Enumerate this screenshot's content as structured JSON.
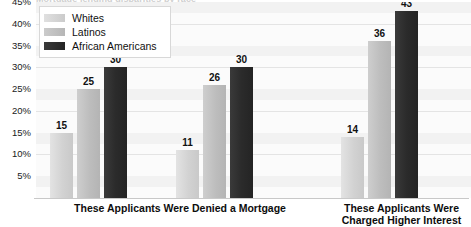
{
  "chart_data": {
    "type": "bar",
    "title": "Mortgage lending disparities by race",
    "categories": [
      "These Applicants Were Denied a Mortgage",
      "These Applicants Were Denied a Mortgage",
      "These Applicants Were Charged Higher Interest"
    ],
    "series": [
      {
        "name": "Whites",
        "values": [
          15,
          11,
          14
        ],
        "color": "#d2d2d2"
      },
      {
        "name": "Latinos",
        "values": [
          25,
          26,
          36
        ],
        "color": "#bdbdbd"
      },
      {
        "name": "African Americans",
        "values": [
          30,
          30,
          43
        ],
        "color": "#2b2b2b"
      }
    ],
    "xlabel": "",
    "ylabel": "",
    "ylim": [
      0,
      45
    ],
    "ytick_labels": [
      "45%",
      "40%",
      "35%",
      "30%",
      "25%",
      "20%",
      "15%",
      "10%",
      "5%"
    ],
    "ytick_values": [
      45,
      40,
      35,
      30,
      25,
      20,
      15,
      10,
      5
    ],
    "grid": true,
    "legend_position": "top-left",
    "value_labels": true
  },
  "legend": {
    "items": [
      {
        "label": "Whites"
      },
      {
        "label": "Latinos"
      },
      {
        "label": "African Americans"
      }
    ]
  },
  "categories": [
    {
      "line1": "These Applicants Were Denied a Mortgage",
      "line2": ""
    },
    {
      "line1": "These Applicants Were",
      "line2": "Charged Higher Interest"
    }
  ]
}
